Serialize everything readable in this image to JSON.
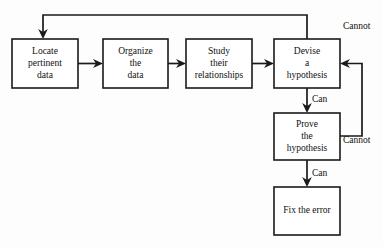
{
  "diagram": {
    "background_color": "#fdfdfd",
    "line_color": "#1a1a1a",
    "box_fill": "#ffffff",
    "nodes": [
      {
        "id": "locate",
        "lines": [
          "Locate",
          "pertinent",
          "data"
        ],
        "x": 12,
        "y": 39,
        "w": 66,
        "h": 49
      },
      {
        "id": "organize",
        "lines": [
          "Organize",
          "the",
          "data"
        ],
        "x": 103,
        "y": 39,
        "w": 65,
        "h": 49
      },
      {
        "id": "study",
        "lines": [
          "Study",
          "their",
          "relationships"
        ],
        "x": 186,
        "y": 39,
        "w": 66,
        "h": 49
      },
      {
        "id": "devise",
        "lines": [
          "Devise",
          "a",
          "hypothesis"
        ],
        "x": 274,
        "y": 39,
        "w": 66,
        "h": 49
      },
      {
        "id": "prove",
        "lines": [
          "Prove",
          "the",
          "hypothesis"
        ],
        "x": 274,
        "y": 113,
        "w": 66,
        "h": 47
      },
      {
        "id": "fix",
        "lines": [
          "Fix the error"
        ],
        "x": 274,
        "y": 187,
        "w": 66,
        "h": 48
      }
    ],
    "edge_labels": [
      {
        "id": "cannot-top",
        "text": "Cannot",
        "x": 343,
        "y": 27
      },
      {
        "id": "can-devise-prove",
        "text": "Can",
        "x": 312,
        "y": 100
      },
      {
        "id": "cannot-prove",
        "text": "Cannot",
        "x": 343,
        "y": 141
      },
      {
        "id": "can-prove-fix",
        "text": "Can",
        "x": 312,
        "y": 174
      }
    ]
  }
}
